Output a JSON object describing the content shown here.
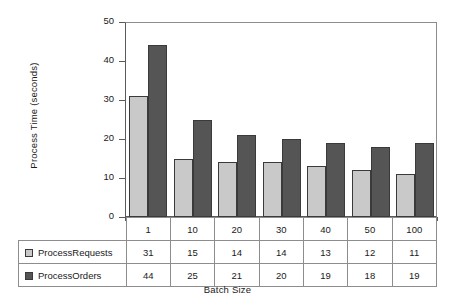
{
  "chart_data": {
    "type": "bar",
    "title": "",
    "xlabel": "Batch Size",
    "ylabel": "Process Time (seconds)",
    "categories": [
      "1",
      "10",
      "20",
      "30",
      "40",
      "50",
      "100"
    ],
    "series": [
      {
        "name": "ProcessRequests",
        "color": "#c9c9c9",
        "values": [
          31,
          15,
          14,
          14,
          13,
          12,
          11
        ]
      },
      {
        "name": "ProcessOrders",
        "color": "#555555",
        "values": [
          44,
          25,
          21,
          20,
          19,
          18,
          19
        ]
      }
    ],
    "ylim": [
      0,
      50
    ],
    "yticks": [
      0,
      10,
      20,
      30,
      40,
      50
    ],
    "grid": false,
    "legend": "data-table",
    "data_table_visible": true
  }
}
